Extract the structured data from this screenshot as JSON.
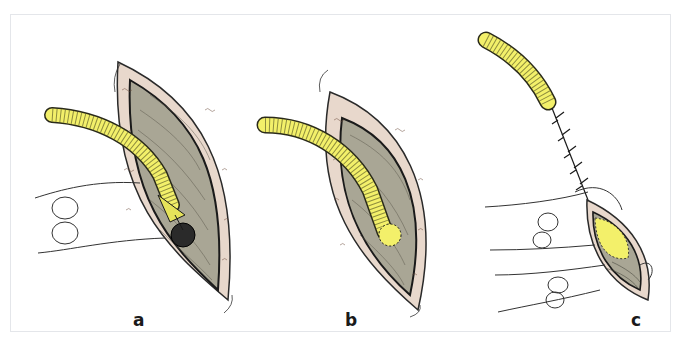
{
  "figure": {
    "type": "surgical-illustration",
    "panels": [
      {
        "id": "a",
        "label": "a",
        "description": "Tube end split and passed through incision with purse-string suture loops; dark circular opening below tube tip"
      },
      {
        "id": "b",
        "label": "b",
        "description": "Tube end sutured in place within open wound bed"
      },
      {
        "id": "c",
        "label": "c",
        "description": "Tube tunneled with running suture line; wound being closed with sutures"
      }
    ],
    "colors": {
      "tube": "#f3f06a",
      "tube_ridge": "#3a3a1a",
      "skin_edge": "#e8d8cc",
      "wound_bed": "#a9a695",
      "outline": "#2a2a2a",
      "hole": "#2a2a2a",
      "frame_border": "#e4e6ea",
      "background": "#ffffff"
    }
  }
}
